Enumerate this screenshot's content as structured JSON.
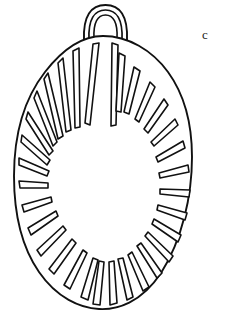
{
  "page": {
    "width": 228,
    "height": 319,
    "background_color": "#ffffff",
    "ink_color": "#111111",
    "kind": "line-drawing illustration on book page"
  },
  "figure": {
    "name": "pendant-line-drawing",
    "stroke_color": "#111111",
    "fill_color": "#ffffff",
    "outline": {
      "name": "pendant-body-outline",
      "top_y": 35,
      "bottom_y": 308,
      "left_x": 14,
      "right_x": 192,
      "center_x": 100,
      "widest_y": 205
    },
    "suspension_loop": {
      "name": "suspension-loop",
      "center_x": 105,
      "top_y": 4,
      "bottom_y": 38,
      "outer_width": 44,
      "inner_width": 28,
      "line_count": 3
    },
    "center_field": {
      "name": "plain-oval-centre",
      "center_x": 97,
      "center_y": 168,
      "radius_x": 38,
      "radius_y": 54
    },
    "rays": {
      "name": "radiating-slots",
      "count": 32,
      "shape": "long tapered slot with rounded ends",
      "note": "slots radiate outward from the plain oval centre to the pendant rim"
    }
  },
  "margin_text": {
    "name": "body-text-fragment",
    "note": "book body text cut off at the right edge of the crop",
    "lines": [
      "c",
      "W",
      "to",
      "ch"
    ]
  }
}
